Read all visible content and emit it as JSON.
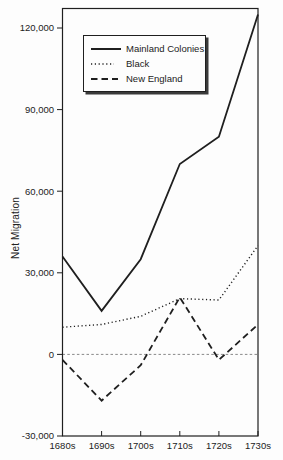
{
  "figure": {
    "background": "#fdfdfd",
    "ink_color": "#1f1f1f",
    "text_color": "#222222",
    "zero_line_color": "#6a6a6a"
  },
  "chart_data": {
    "type": "line",
    "title": "",
    "xlabel": "",
    "ylabel": "Net Migration",
    "categories": [
      "1680s",
      "1690s",
      "1700s",
      "1710s",
      "1720s",
      "1730s"
    ],
    "ylim": [
      -30000,
      120000
    ],
    "yticks": [
      120000,
      90000,
      60000,
      30000,
      0,
      -30000
    ],
    "ytick_labels": [
      "120,000",
      "90,000",
      "60,000",
      "30,000",
      "0",
      "-30,000"
    ],
    "grid": "zero-reference-line-only",
    "legend_position": "upper-left-inside",
    "series": [
      {
        "name": "Mainland Colonies",
        "style": "solid",
        "values": [
          36000,
          16000,
          35000,
          70000,
          80000,
          125000
        ]
      },
      {
        "name": "Black",
        "style": "dotted",
        "values": [
          10000,
          11000,
          14000,
          20500,
          20000,
          40000
        ]
      },
      {
        "name": "New England",
        "style": "dashed",
        "values": [
          -2000,
          -17000,
          -4000,
          21000,
          -2000,
          11000
        ]
      }
    ]
  }
}
